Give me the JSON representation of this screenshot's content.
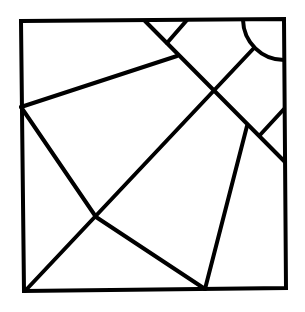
{
  "diagram": {
    "width": 305,
    "height": 312,
    "stroke_color": "#000000",
    "background": "#ffffff",
    "stroke_width": 4,
    "frame": {
      "points": "21,21 284,19 286,288 24,291"
    },
    "segments": [
      {
        "name": "diagonal-top-to-right",
        "x1": 145,
        "y1": 21,
        "x2": 285,
        "y2": 162
      },
      {
        "name": "short-top-segment",
        "x1": 187,
        "y1": 20,
        "x2": 167,
        "y2": 43
      },
      {
        "name": "left-to-top-center",
        "x1": 21,
        "y1": 107,
        "x2": 177,
        "y2": 56
      },
      {
        "name": "arc-to-bottom-left",
        "x1": 254,
        "y1": 48,
        "x2": 25,
        "y2": 291
      },
      {
        "name": "left-to-cross-point",
        "x1": 21,
        "y1": 107,
        "x2": 96,
        "y2": 217
      },
      {
        "name": "cross-point-to-bottom",
        "x1": 96,
        "y1": 217,
        "x2": 205,
        "y2": 289
      },
      {
        "name": "right-slant-to-bottom",
        "x1": 247,
        "y1": 126,
        "x2": 205,
        "y2": 289
      },
      {
        "name": "short-right-segment",
        "x1": 284,
        "y1": 109,
        "x2": 260,
        "y2": 135
      }
    ],
    "arc": {
      "d": "M 243 20 A 41 41 0 0 0 284 60"
    }
  }
}
